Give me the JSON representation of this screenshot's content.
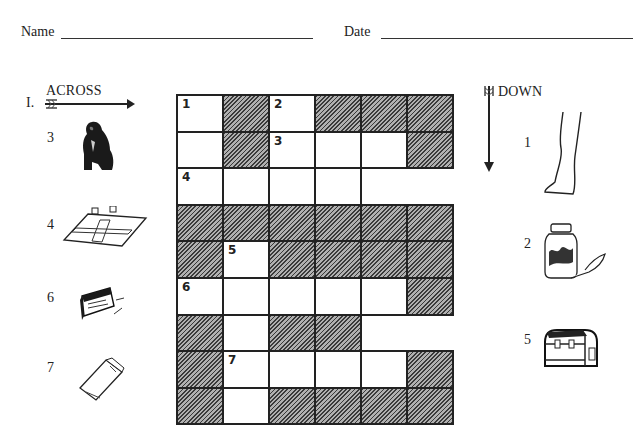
{
  "header": {
    "name_label": "Name",
    "date_label": "Date"
  },
  "across": {
    "title": "ACROSS",
    "start_marker": "I.",
    "clues": [
      {
        "number": "3",
        "icon": "gorilla-icon"
      },
      {
        "number": "4",
        "icon": "board-game-icon"
      },
      {
        "number": "6",
        "icon": "box-icon"
      },
      {
        "number": "7",
        "icon": "carton-icon"
      }
    ]
  },
  "down": {
    "title": "DOWN",
    "clues": [
      {
        "number": "1",
        "icon": "leg-icon"
      },
      {
        "number": "2",
        "icon": "jam-jar-icon"
      },
      {
        "number": "5",
        "icon": "lunchbox-icon"
      }
    ]
  },
  "grid": {
    "rows": 9,
    "cols": 6,
    "cells": [
      [
        {
          "t": "w",
          "n": "1"
        },
        {
          "t": "s"
        },
        {
          "t": "w",
          "n": "2"
        },
        {
          "t": "s"
        },
        {
          "t": "s"
        },
        {
          "t": "s"
        }
      ],
      [
        {
          "t": "w"
        },
        {
          "t": "s"
        },
        {
          "t": "w",
          "n": "3"
        },
        {
          "t": "w"
        },
        {
          "t": "w"
        },
        {
          "t": "s"
        }
      ],
      [
        {
          "t": "w",
          "n": "4"
        },
        {
          "t": "w"
        },
        {
          "t": "w"
        },
        {
          "t": "w"
        },
        {
          "t": "x"
        },
        {
          "t": "x"
        }
      ],
      [
        {
          "t": "s"
        },
        {
          "t": "s"
        },
        {
          "t": "s"
        },
        {
          "t": "s"
        },
        {
          "t": "s"
        },
        {
          "t": "s"
        }
      ],
      [
        {
          "t": "s"
        },
        {
          "t": "w",
          "n": "5"
        },
        {
          "t": "s"
        },
        {
          "t": "s"
        },
        {
          "t": "s"
        },
        {
          "t": "s"
        }
      ],
      [
        {
          "t": "w",
          "n": "6"
        },
        {
          "t": "w"
        },
        {
          "t": "w"
        },
        {
          "t": "w"
        },
        {
          "t": "w"
        },
        {
          "t": "s"
        }
      ],
      [
        {
          "t": "s"
        },
        {
          "t": "w"
        },
        {
          "t": "s"
        },
        {
          "t": "s"
        },
        {
          "t": "x"
        },
        {
          "t": "x"
        }
      ],
      [
        {
          "t": "s"
        },
        {
          "t": "w",
          "n": "7"
        },
        {
          "t": "w"
        },
        {
          "t": "w"
        },
        {
          "t": "w"
        },
        {
          "t": "s"
        }
      ],
      [
        {
          "t": "s"
        },
        {
          "t": "w"
        },
        {
          "t": "s"
        },
        {
          "t": "s"
        },
        {
          "t": "s"
        },
        {
          "t": "s"
        }
      ]
    ]
  }
}
